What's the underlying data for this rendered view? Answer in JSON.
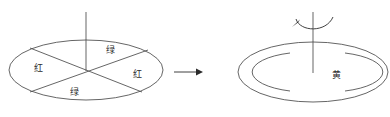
{
  "figure": {
    "title": "",
    "type": "physics-illustration",
    "background_color": "#ffffff",
    "stroke_color": "#4a4a4a",
    "text_color": "#2b2b2b"
  },
  "left_disk": {
    "name": "stationary-sectored-disk",
    "center": {
      "x": 86,
      "y": 70
    },
    "rx": 77,
    "ry": 30,
    "axis": {
      "x": 86,
      "y_top": 12,
      "y_bottom": 70
    },
    "sectors": [
      {
        "position": "top",
        "label": "绿",
        "label_x": 110,
        "label_y": 50
      },
      {
        "position": "left",
        "label": "红",
        "label_x": 38,
        "label_y": 68
      },
      {
        "position": "right",
        "label": "红",
        "label_x": 137,
        "label_y": 74
      },
      {
        "position": "bottom",
        "label": "绿",
        "label_x": 74,
        "label_y": 92
      }
    ]
  },
  "transition_arrow": {
    "name": "transition-arrow",
    "x_start": 174,
    "x_end": 200,
    "y": 72
  },
  "right_disk": {
    "name": "spinning-disk",
    "center": {
      "x": 313,
      "y": 72
    },
    "rx": 75,
    "ry": 30,
    "inner_rx": 55,
    "inner_ry": 20,
    "axis": {
      "x": 313,
      "y_top": 12,
      "y_bottom": 73
    },
    "label": "黄",
    "label_x": 336,
    "label_y": 75,
    "rotation_arrow": {
      "name": "rotation-arrow",
      "description": "curved arrow indicating spin about vertical axis"
    }
  }
}
